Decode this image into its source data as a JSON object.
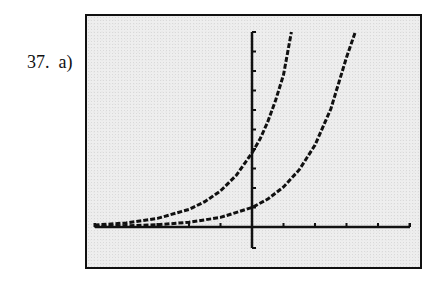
{
  "problem": {
    "number": "37.",
    "part": "a)"
  },
  "colors": {
    "ink": "#111111",
    "screen": "#eeeeee",
    "page": "#ffffff"
  },
  "chart_data": {
    "type": "line",
    "title": "",
    "xlabel": "",
    "ylabel": "",
    "grid": false,
    "legend": null,
    "axis_ranges": {
      "xlim": [
        -5,
        5
      ],
      "ylim": [
        -1,
        10
      ]
    },
    "x_ticks": [
      -5,
      -4,
      -3,
      -2,
      -1,
      1,
      2,
      3,
      4,
      5
    ],
    "y_ticks": [
      1,
      2,
      3,
      4,
      5,
      6,
      7,
      8,
      9,
      10
    ],
    "series": [
      {
        "name": "steeper exponential",
        "x": [
          -5,
          -4,
          -3,
          -2,
          -1.5,
          -1,
          -0.5,
          0,
          0.25,
          0.5,
          0.75,
          1.0,
          1.25
        ],
        "y": [
          0.1,
          0.21,
          0.44,
          0.9,
          1.3,
          1.85,
          2.65,
          3.8,
          4.5,
          5.4,
          6.5,
          7.8,
          10
        ]
      },
      {
        "name": "shallower exponential",
        "x": [
          -5,
          -4,
          -3,
          -2,
          -1,
          0,
          0.5,
          1,
          1.5,
          2,
          2.5,
          3,
          3.28
        ],
        "y": [
          0.03,
          0.06,
          0.12,
          0.24,
          0.49,
          1.0,
          1.43,
          2.05,
          2.94,
          4.2,
          6.05,
          8.7,
          10
        ]
      }
    ],
    "annotations": []
  }
}
